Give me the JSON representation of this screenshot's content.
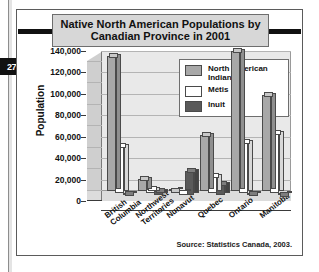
{
  "page_marker": "27",
  "figure": {
    "title": "Native North American Populations by Canadian Province in 2001",
    "source": "Source: Statistics Canada, 2003."
  },
  "chart_data": {
    "type": "bar",
    "title": "Native North American Populations by Canadian Province in 2001",
    "xlabel": "",
    "ylabel": "Population",
    "ylim": [
      0,
      140000
    ],
    "yticks": [
      0,
      20000,
      40000,
      60000,
      80000,
      100000,
      120000,
      140000
    ],
    "ytick_labels": [
      "0",
      "20,000",
      "40,000",
      "60,000",
      "80,000",
      "100,000",
      "120,000",
      "140,000"
    ],
    "grid": true,
    "legend_position": "upper-center-inside",
    "categories": [
      "British\nColumbia",
      "Northwest\nTerritories",
      "Nunavut",
      "Quebec",
      "Ontario",
      "Manitoba"
    ],
    "series": [
      {
        "name": "North American Indian",
        "color": "#a8a8a8",
        "values": [
          126000,
          11000,
          0,
          52000,
          131000,
          90000
        ]
      },
      {
        "name": "Métis",
        "color": "#ffffff",
        "values": [
          44000,
          3500,
          0,
          16000,
          48000,
          56000
        ]
      },
      {
        "name": "Inuit",
        "color": "#5a5a5a",
        "values": [
          800,
          3800,
          22000,
          10000,
          1400,
          400
        ]
      }
    ],
    "legend": [
      {
        "label": "North American Indian",
        "swatch": "#a8a8a8"
      },
      {
        "label": "Métis",
        "swatch": "#ffffff"
      },
      {
        "label": "Inuit",
        "swatch": "#5a5a5a"
      }
    ],
    "annotations": [
      "Source: Statistics Canada, 2003."
    ]
  }
}
